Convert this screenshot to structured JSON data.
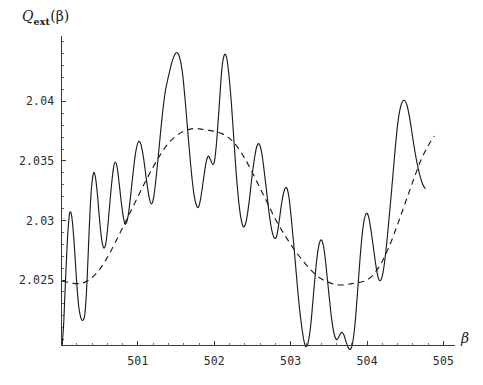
{
  "chart_data": {
    "type": "line",
    "title": "",
    "subtitle": "",
    "xlabel": "β",
    "ylabel": "Q_ext(β)",
    "ylabel_parts": {
      "base": "Q",
      "subscript": "ext",
      "argument": "(β)"
    },
    "xlim": [
      500.0,
      505.15
    ],
    "ylim": [
      2.0195,
      2.0455
    ],
    "grid": false,
    "legend": null,
    "legend_position": "none",
    "axis_origin_label": null,
    "xticks": [
      501,
      502,
      503,
      504,
      505
    ],
    "xtick_labels": [
      "501",
      "502",
      "503",
      "504",
      "505"
    ],
    "xticks_minor_step": 0.2,
    "yticks": [
      2.025,
      2.03,
      2.035,
      2.04
    ],
    "ytick_labels": [
      "2.025",
      "2.03",
      "2.035",
      "2.04"
    ],
    "yticks_minor_step": 0.001,
    "series": [
      {
        "name": "Q_ext exact (oscillatory)",
        "style": "solid",
        "color": "#1c1c1c",
        "points": [
          [
            500.01,
            2.0196
          ],
          [
            500.03,
            2.0215
          ],
          [
            500.05,
            2.0246
          ],
          [
            500.075,
            2.0281
          ],
          [
            500.095,
            2.03
          ],
          [
            500.11,
            2.0307
          ],
          [
            500.13,
            2.0305
          ],
          [
            500.15,
            2.0294
          ],
          [
            500.175,
            2.0272
          ],
          [
            500.2,
            2.0247
          ],
          [
            500.225,
            2.0228
          ],
          [
            500.25,
            2.0219
          ],
          [
            500.275,
            2.0216
          ],
          [
            500.3,
            2.0219
          ],
          [
            500.315,
            2.0228
          ],
          [
            500.335,
            2.025
          ],
          [
            500.355,
            2.0281
          ],
          [
            500.375,
            2.031
          ],
          [
            500.395,
            2.0329
          ],
          [
            500.42,
            2.034
          ],
          [
            500.445,
            2.0336
          ],
          [
            500.47,
            2.0322
          ],
          [
            500.495,
            2.0303
          ],
          [
            500.52,
            2.0287
          ],
          [
            500.545,
            2.0278
          ],
          [
            500.57,
            2.0278
          ],
          [
            500.595,
            2.0288
          ],
          [
            500.62,
            2.0305
          ],
          [
            500.65,
            2.0327
          ],
          [
            500.68,
            2.0344
          ],
          [
            500.705,
            2.0349
          ],
          [
            500.73,
            2.0344
          ],
          [
            500.755,
            2.0331
          ],
          [
            500.785,
            2.0314
          ],
          [
            500.815,
            2.0301
          ],
          [
            500.84,
            2.0297
          ],
          [
            500.87,
            2.0303
          ],
          [
            500.9,
            2.0318
          ],
          [
            500.935,
            2.0339
          ],
          [
            500.97,
            2.0357
          ],
          [
            501.005,
            2.0366
          ],
          [
            501.04,
            2.0364
          ],
          [
            501.075,
            2.0352
          ],
          [
            501.11,
            2.0335
          ],
          [
            501.145,
            2.032
          ],
          [
            501.175,
            2.0314
          ],
          [
            501.205,
            2.0319
          ],
          [
            501.24,
            2.0337
          ],
          [
            501.28,
            2.0363
          ],
          [
            501.32,
            2.0389
          ],
          [
            501.36,
            2.0409
          ],
          [
            501.4,
            2.0421
          ],
          [
            501.44,
            2.0432
          ],
          [
            501.48,
            2.0439
          ],
          [
            501.515,
            2.0441
          ],
          [
            501.55,
            2.0436
          ],
          [
            501.585,
            2.0423
          ],
          [
            501.62,
            2.04
          ],
          [
            501.655,
            2.0373
          ],
          [
            501.69,
            2.0347
          ],
          [
            501.725,
            2.0326
          ],
          [
            501.76,
            2.0314
          ],
          [
            501.79,
            2.0311
          ],
          [
            501.82,
            2.0318
          ],
          [
            501.855,
            2.0333
          ],
          [
            501.89,
            2.0348
          ],
          [
            501.92,
            2.0354
          ],
          [
            501.95,
            2.0351
          ],
          [
            501.98,
            2.0347
          ],
          [
            502.005,
            2.0351
          ],
          [
            502.035,
            2.037
          ],
          [
            502.07,
            2.0402
          ],
          [
            502.1,
            2.0428
          ],
          [
            502.13,
            2.0439
          ],
          [
            502.16,
            2.0437
          ],
          [
            502.19,
            2.0423
          ],
          [
            502.225,
            2.0397
          ],
          [
            502.26,
            2.0364
          ],
          [
            502.295,
            2.0333
          ],
          [
            502.33,
            2.031
          ],
          [
            502.365,
            2.0297
          ],
          [
            502.395,
            2.0295
          ],
          [
            502.425,
            2.0302
          ],
          [
            502.46,
            2.0318
          ],
          [
            502.495,
            2.0338
          ],
          [
            502.53,
            2.0354
          ],
          [
            502.56,
            2.0363
          ],
          [
            502.59,
            2.0364
          ],
          [
            502.62,
            2.0357
          ],
          [
            502.65,
            2.0343
          ],
          [
            502.685,
            2.0324
          ],
          [
            502.72,
            2.0305
          ],
          [
            502.755,
            2.0291
          ],
          [
            502.79,
            2.0285
          ],
          [
            502.82,
            2.0288
          ],
          [
            502.85,
            2.03
          ],
          [
            502.885,
            2.0316
          ],
          [
            502.92,
            2.0326
          ],
          [
            502.95,
            2.0327
          ],
          [
            502.98,
            2.0318
          ],
          [
            503.01,
            2.03
          ],
          [
            503.045,
            2.0276
          ],
          [
            503.08,
            2.025
          ],
          [
            503.115,
            2.0226
          ],
          [
            503.15,
            2.0208
          ],
          [
            503.18,
            2.0197
          ],
          [
            503.205,
            2.0194
          ],
          [
            503.23,
            2.0198
          ],
          [
            503.26,
            2.0211
          ],
          [
            503.29,
            2.0232
          ],
          [
            503.32,
            2.0254
          ],
          [
            503.35,
            2.0272
          ],
          [
            503.38,
            2.0282
          ],
          [
            503.41,
            2.0283
          ],
          [
            503.44,
            2.0274
          ],
          [
            503.47,
            2.0257
          ],
          [
            503.505,
            2.0235
          ],
          [
            503.54,
            2.0215
          ],
          [
            503.575,
            2.0203
          ],
          [
            503.605,
            2.02
          ],
          [
            503.635,
            2.0203
          ],
          [
            503.665,
            2.0206
          ],
          [
            503.695,
            2.0204
          ],
          [
            503.725,
            2.0198
          ],
          [
            503.755,
            2.0193
          ],
          [
            503.785,
            2.0192
          ],
          [
            503.81,
            2.0197
          ],
          [
            503.84,
            2.0212
          ],
          [
            503.87,
            2.0236
          ],
          [
            503.9,
            2.0262
          ],
          [
            503.93,
            2.0285
          ],
          [
            503.96,
            2.03
          ],
          [
            503.99,
            2.0306
          ],
          [
            504.02,
            2.0303
          ],
          [
            504.05,
            2.0292
          ],
          [
            504.085,
            2.0276
          ],
          [
            504.12,
            2.026
          ],
          [
            504.15,
            2.0251
          ],
          [
            504.18,
            2.025
          ],
          [
            504.21,
            2.0257
          ],
          [
            504.245,
            2.0274
          ],
          [
            504.28,
            2.0297
          ],
          [
            504.32,
            2.0325
          ],
          [
            504.36,
            2.0355
          ],
          [
            504.4,
            2.0381
          ],
          [
            504.44,
            2.0396
          ],
          [
            504.48,
            2.0401
          ],
          [
            504.52,
            2.0397
          ],
          [
            504.56,
            2.0385
          ],
          [
            504.6,
            2.0368
          ],
          [
            504.645,
            2.0351
          ],
          [
            504.69,
            2.0338
          ],
          [
            504.73,
            2.033
          ],
          [
            504.76,
            2.0327
          ]
        ]
      },
      {
        "name": "Q_ext averaged (smooth)",
        "style": "dashed",
        "color": "#1c1c1c",
        "points": [
          [
            500.01,
            2.0249
          ],
          [
            500.1,
            2.0248
          ],
          [
            500.2,
            2.0247
          ],
          [
            500.3,
            2.0248
          ],
          [
            500.4,
            2.0252
          ],
          [
            500.5,
            2.0259
          ],
          [
            500.6,
            2.0269
          ],
          [
            500.7,
            2.0281
          ],
          [
            500.8,
            2.0294
          ],
          [
            500.9,
            2.0307
          ],
          [
            501.0,
            2.032
          ],
          [
            501.1,
            2.0333
          ],
          [
            501.2,
            2.0345
          ],
          [
            501.3,
            2.0356
          ],
          [
            501.4,
            2.0365
          ],
          [
            501.5,
            2.0371
          ],
          [
            501.6,
            2.0375
          ],
          [
            501.7,
            2.0377
          ],
          [
            501.8,
            2.0377
          ],
          [
            501.9,
            2.0376
          ],
          [
            502.0,
            2.0375
          ],
          [
            502.1,
            2.0373
          ],
          [
            502.2,
            2.0369
          ],
          [
            502.3,
            2.0362
          ],
          [
            502.4,
            2.0352
          ],
          [
            502.5,
            2.034
          ],
          [
            502.6,
            2.0327
          ],
          [
            502.7,
            2.0314
          ],
          [
            502.8,
            2.0301
          ],
          [
            502.9,
            2.029
          ],
          [
            503.0,
            2.028
          ],
          [
            503.1,
            2.0271
          ],
          [
            503.2,
            2.0263
          ],
          [
            503.3,
            2.0256
          ],
          [
            503.4,
            2.0251
          ],
          [
            503.5,
            2.0248
          ],
          [
            503.6,
            2.0246
          ],
          [
            503.7,
            2.0246
          ],
          [
            503.8,
            2.0247
          ],
          [
            503.9,
            2.0248
          ],
          [
            504.0,
            2.025
          ],
          [
            504.1,
            2.0256
          ],
          [
            504.2,
            2.0266
          ],
          [
            504.3,
            2.028
          ],
          [
            504.4,
            2.0297
          ],
          [
            504.5,
            2.0315
          ],
          [
            504.6,
            2.0333
          ],
          [
            504.7,
            2.035
          ],
          [
            504.8,
            2.0363
          ],
          [
            504.88,
            2.0371
          ]
        ]
      }
    ]
  },
  "axes": {
    "y_axis_title_base": "Q",
    "y_axis_title_sub": "ext",
    "y_axis_title_arg": "(β)",
    "x_axis_title": "β",
    "x_tick_labels": [
      "501",
      "502",
      "503",
      "504",
      "505"
    ],
    "y_tick_labels": [
      "2.025",
      "2.03",
      "2.035",
      "2.04"
    ]
  }
}
